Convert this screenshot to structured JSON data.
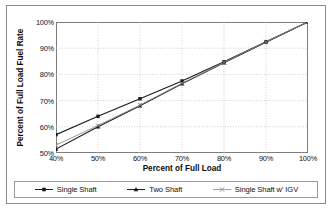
{
  "chart_data": {
    "type": "line",
    "title": "",
    "xlabel": "Percent of Full Load",
    "ylabel": "Percent of Full Load Fuel Rate",
    "x": [
      40,
      50,
      60,
      70,
      80,
      90,
      100
    ],
    "xtick_labels": [
      "40%",
      "50%",
      "60%",
      "70%",
      "80%",
      "90%",
      "100%"
    ],
    "ytick_labels": [
      "50%",
      "60%",
      "70%",
      "80%",
      "90%",
      "100%"
    ],
    "yticks": [
      50,
      60,
      70,
      80,
      90,
      100
    ],
    "xlim": [
      40,
      100
    ],
    "ylim": [
      50,
      100
    ],
    "grid": true,
    "legend_position": "bottom",
    "series": [
      {
        "name": "Single Shaft",
        "marker": "square",
        "color": "#1a1a1a",
        "values": [
          57.0,
          64.0,
          70.7,
          77.5,
          84.8,
          92.5,
          100.0
        ]
      },
      {
        "name": "Two Shaft",
        "marker": "triangle",
        "color": "#1a1a1a",
        "values": [
          51.5,
          60.0,
          68.0,
          76.4,
          84.4,
          92.3,
          100.0
        ]
      },
      {
        "name": "Single Shaft w' IGV",
        "marker": "x",
        "color": "#8c8c8c",
        "values": [
          53.0,
          60.5,
          68.3,
          76.6,
          84.6,
          92.4,
          100.0
        ]
      }
    ]
  },
  "legend": {
    "items": [
      {
        "label": "Single Shaft"
      },
      {
        "label": "Two Shaft"
      },
      {
        "label": "Single Shaft w' IGV"
      }
    ]
  },
  "colors": {
    "frame": "#8a8a8a",
    "plot_border": "#7d7d7d",
    "gridline": "#b9b9b9",
    "series_dark": "#1a1a1a",
    "series_gray": "#8c8c8c",
    "background": "#ffffff"
  }
}
